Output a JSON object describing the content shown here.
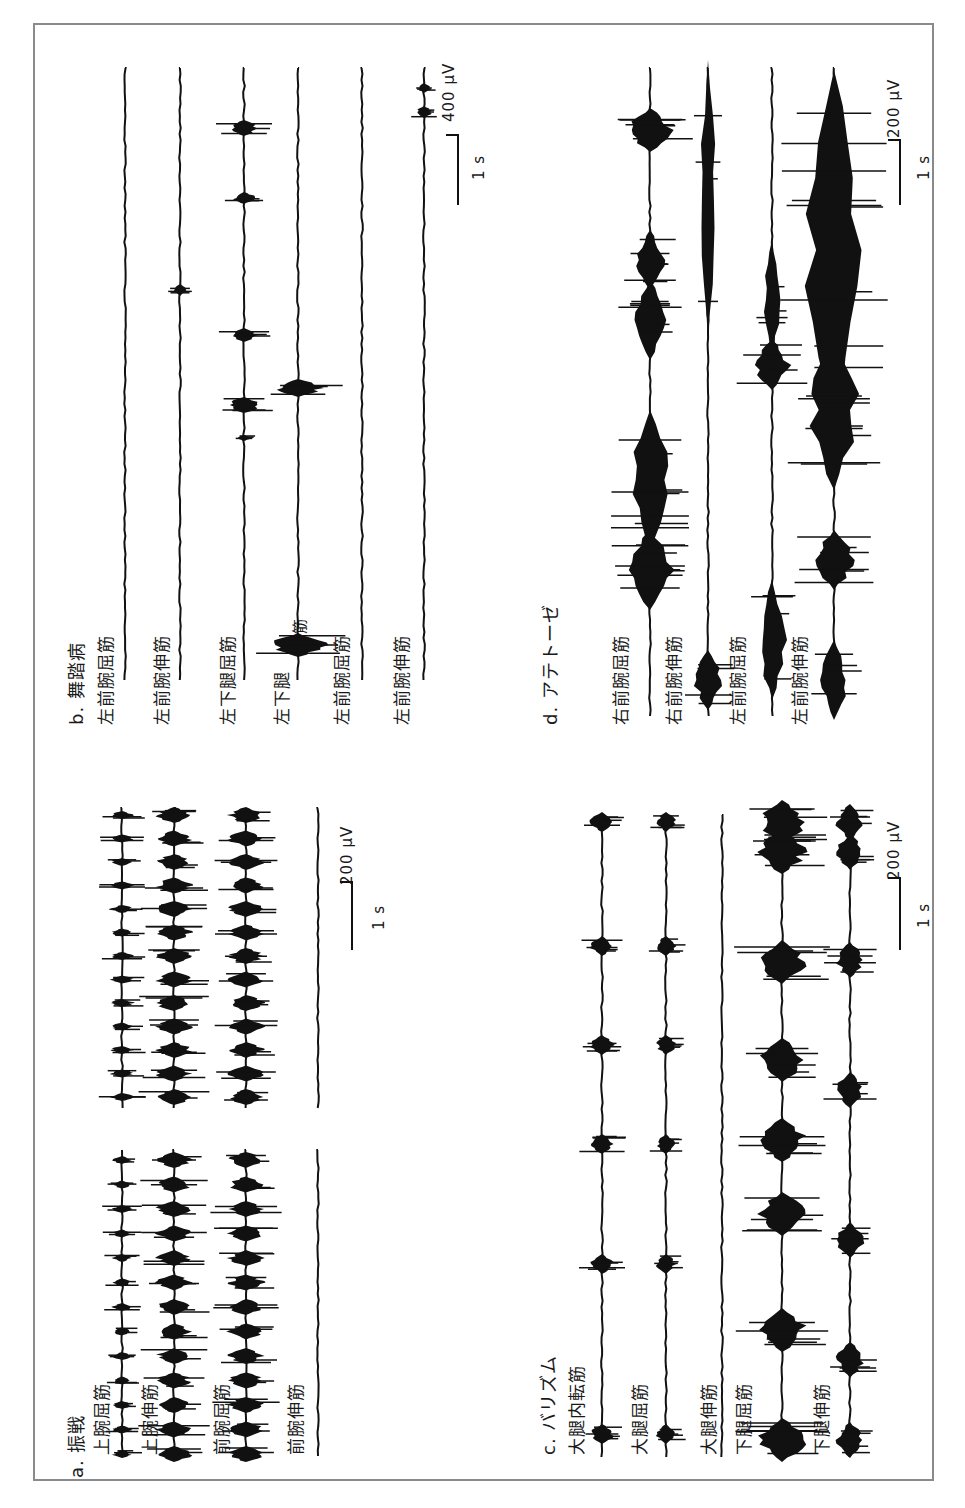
{
  "figure": {
    "orientation": "rotated -90deg (read with head tilted left)",
    "panels": [
      {
        "id": "a",
        "title": "a. 振戦",
        "traces": [
          {
            "label": "上腕屈筋"
          },
          {
            "label": "上腕伸筋"
          },
          {
            "label": "前腕屈筋"
          },
          {
            "label": "前腕伸筋"
          }
        ],
        "scale": {
          "amplitude": "200 μV",
          "time": "1 s"
        }
      },
      {
        "id": "b",
        "title": "b. 舞踏病",
        "traces": [
          {
            "label": "左前腕屈筋"
          },
          {
            "label": "左前腕伸筋"
          },
          {
            "label": "左下腿屈筋"
          },
          {
            "label": "左下腿",
            "label_suffix": "伸筋"
          },
          {
            "label": "左前腕屈筋"
          },
          {
            "label": "左前腕伸筋"
          }
        ],
        "scale": {
          "amplitude": "400 μV",
          "time": "1 s"
        }
      },
      {
        "id": "c",
        "title": "c. バリズム",
        "traces": [
          {
            "label": "大腿内転筋"
          },
          {
            "label": "大腿屈筋"
          },
          {
            "label": "大腿伸筋"
          },
          {
            "label": "下腿屈筋"
          },
          {
            "label": "下腿伸筋"
          }
        ],
        "scale": {
          "amplitude": "200 μV",
          "time": "1 s"
        }
      },
      {
        "id": "d",
        "title": "d. アテトーゼ",
        "traces": [
          {
            "label": "右前腕屈筋"
          },
          {
            "label": "右前腕伸筋"
          },
          {
            "label": "左前腕屈筋"
          },
          {
            "label": "左前腕伸筋"
          }
        ],
        "scale": {
          "amplitude": "200 μV",
          "time": "1 s"
        }
      }
    ]
  },
  "colors": {
    "ink": "#111111",
    "frame": "#8a8a8a",
    "background": "#ffffff"
  }
}
